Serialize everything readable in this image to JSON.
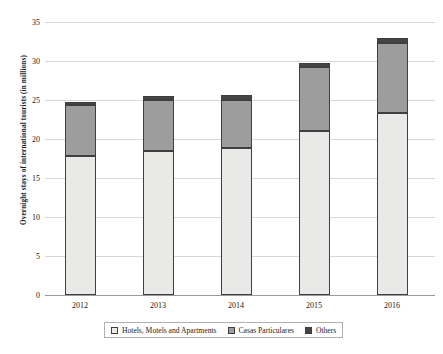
{
  "chart_data": {
    "type": "bar",
    "subtype": "stacked-bar",
    "title": "",
    "xlabel": "",
    "ylabel": "Overnight stays of international tourists (in millions)",
    "categories": [
      "2012",
      "2013",
      "2014",
      "2015",
      "2016"
    ],
    "series": [
      {
        "name": "Hotels, Motels and Apartments",
        "color": "#e9e9e7",
        "values": [
          17.8,
          18.4,
          18.8,
          21.0,
          23.3
        ]
      },
      {
        "name": "Casas Particulares",
        "color": "#9d9d9d",
        "values": [
          6.5,
          6.6,
          6.2,
          8.2,
          9.0
        ]
      },
      {
        "name": "Others",
        "color": "#454545",
        "values": [
          0.5,
          0.5,
          0.6,
          0.6,
          0.7
        ]
      }
    ],
    "totals": [
      24.8,
      25.5,
      25.6,
      29.8,
      33.0
    ],
    "ylim": [
      0,
      35
    ],
    "yticks": [
      "0",
      "5",
      "10",
      "15",
      "20",
      "25",
      "30",
      "35"
    ],
    "ytick_values": [
      0,
      5,
      10,
      15,
      20,
      25,
      30,
      35
    ],
    "grid": true,
    "legend_position": "bottom"
  },
  "legend": {
    "items": [
      {
        "label": "Hotels, Motels and Apartments",
        "color": "#e9e9e7"
      },
      {
        "label": "Casas Particulares",
        "color": "#9d9d9d"
      },
      {
        "label": "Others",
        "color": "#454545"
      }
    ]
  }
}
